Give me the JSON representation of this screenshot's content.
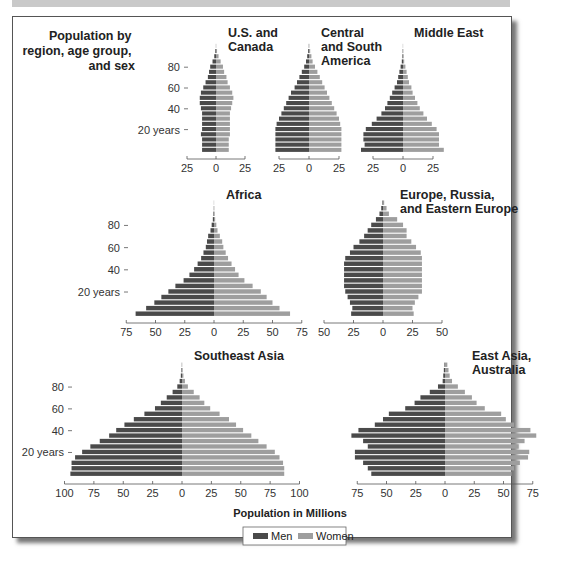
{
  "figure": {
    "title_lines": [
      "Population by",
      "region, age group,",
      "and sex"
    ],
    "xlabel": "Population in Millions",
    "legend": [
      {
        "label": "Men",
        "color": "#4a4a4a"
      },
      {
        "label": "Women",
        "color": "#9e9e9e"
      }
    ],
    "age_labels": [
      "80",
      "60",
      "40",
      "20 years"
    ]
  },
  "chart_data": {
    "type": "population-pyramid",
    "title": "Population by region, age group, and sex",
    "xlabel": "Population in Millions",
    "age_groups": [
      "0-4",
      "5-9",
      "10-14",
      "15-19",
      "20-24",
      "25-29",
      "30-34",
      "35-39",
      "40-44",
      "45-49",
      "50-54",
      "55-59",
      "60-64",
      "65-69",
      "70-74",
      "75-79",
      "80-84",
      "85-89",
      "90-94",
      "95-99",
      "100+"
    ],
    "legend": [
      "Men",
      "Women"
    ],
    "colors": {
      "men": "#4a4a4a",
      "women": "#9e9e9e"
    },
    "panels": [
      {
        "name": "U.S. and Canada",
        "title_lines": [
          "U.S. and",
          "Canada"
        ],
        "xlim": 25,
        "ticks": [
          "25",
          "0",
          "25"
        ],
        "men": [
          12,
          12,
          12,
          13,
          12,
          12,
          12,
          12,
          13,
          14,
          14,
          13,
          11,
          9,
          7,
          6,
          5,
          3,
          1.5,
          0.6,
          0.1
        ],
        "women": [
          11,
          11,
          11,
          12,
          12,
          12,
          12,
          12,
          13,
          14,
          15,
          14,
          12,
          10,
          9,
          7,
          6,
          4,
          2.2,
          0.9,
          0.2
        ]
      },
      {
        "name": "Central and South America",
        "title_lines": [
          "Central",
          "and South",
          "America"
        ],
        "xlim": 25,
        "ticks": [
          "25",
          "0",
          "25"
        ],
        "men": [
          28,
          28,
          28,
          28,
          28,
          27,
          25,
          23,
          21,
          19,
          17,
          15,
          12,
          10,
          8,
          6,
          4,
          2.5,
          1.5,
          0.7,
          0.2
        ],
        "women": [
          27,
          27,
          27,
          27,
          27,
          26,
          25,
          23,
          21,
          19,
          17,
          15,
          13,
          11,
          9,
          7,
          5,
          3,
          2,
          1,
          0.3
        ]
      },
      {
        "name": "Middle East",
        "title_lines": [
          "Middle East"
        ],
        "xlim": 25,
        "ticks": [
          "25",
          "0",
          "25"
        ],
        "men": [
          35,
          32,
          33,
          33,
          31,
          26,
          22,
          18,
          15,
          13,
          11,
          9,
          7,
          5,
          4,
          3,
          2,
          1,
          0.5,
          0.3,
          0.1
        ],
        "women": [
          34,
          30,
          30,
          30,
          28,
          24,
          20,
          17,
          14,
          12,
          10,
          8,
          7,
          5,
          4,
          3,
          2,
          1,
          0.6,
          0.3,
          0.1
        ]
      },
      {
        "name": "Africa",
        "title_lines": [
          "Africa"
        ],
        "xlim": 75,
        "ticks": [
          "75",
          "50",
          "25",
          "0",
          "25",
          "50",
          "75"
        ],
        "men": [
          67,
          58,
          51,
          45,
          39,
          33,
          26,
          21,
          17,
          14,
          11,
          9,
          7,
          6,
          5,
          3,
          2,
          1,
          0.5,
          0.2,
          0.1
        ],
        "women": [
          65,
          56,
          50,
          45,
          40,
          33,
          26,
          21,
          18,
          15,
          12,
          10,
          8,
          7,
          5,
          3,
          2,
          1,
          0.6,
          0.3,
          0.1
        ]
      },
      {
        "name": "Europe, Russia, and Eastern Europe",
        "title_lines": [
          "Europe, Russia,",
          "and Eastern Europe"
        ],
        "xlim": 50,
        "ticks": [
          "50",
          "25",
          "0",
          "25",
          "50"
        ],
        "men": [
          27,
          26,
          28,
          30,
          32,
          33,
          33,
          33,
          33,
          33,
          32,
          28,
          25,
          20,
          16,
          13,
          10,
          6,
          3,
          1.5,
          0.5
        ],
        "women": [
          26,
          25,
          27,
          30,
          33,
          33,
          33,
          33,
          33,
          33,
          33,
          32,
          28,
          24,
          20,
          20,
          17,
          12,
          5,
          3,
          1
        ]
      },
      {
        "name": "Southeast Asia",
        "title_lines": [
          "Southeast Asia"
        ],
        "xlim": 100,
        "ticks": [
          "100",
          "75",
          "50",
          "25",
          "0",
          "25",
          "50",
          "75",
          "100"
        ],
        "men": [
          95,
          94,
          94,
          91,
          85,
          78,
          70,
          62,
          56,
          49,
          41,
          32,
          23,
          18,
          13,
          8,
          4,
          2,
          1,
          0.5,
          0.2
        ],
        "women": [
          87,
          87,
          86,
          83,
          79,
          72,
          65,
          59,
          52,
          46,
          40,
          32,
          24,
          19,
          15,
          10,
          5,
          2.5,
          1.2,
          0.6,
          0.2
        ]
      },
      {
        "name": "East Asia, Australia",
        "title_lines": [
          "East Asia,",
          "Australia"
        ],
        "xlim": 75,
        "ticks": [
          "75",
          "50",
          "25",
          "0",
          "25",
          "50",
          "75"
        ],
        "men": [
          63,
          66,
          70,
          77,
          77,
          66,
          70,
          80,
          74,
          60,
          53,
          48,
          34,
          26,
          21,
          13,
          6,
          2,
          1.5,
          1,
          0.5
        ],
        "women": [
          57,
          59,
          64,
          71,
          72,
          63,
          68,
          78,
          73,
          59,
          52,
          48,
          34,
          27,
          23,
          17,
          11,
          6,
          4,
          3,
          2
        ]
      }
    ]
  }
}
